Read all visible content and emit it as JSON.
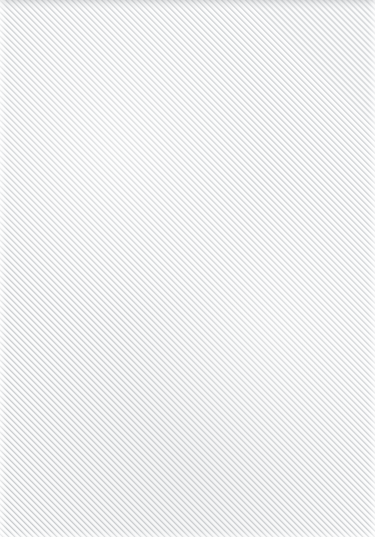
{
  "canvas": {
    "width": 375,
    "height": 537,
    "description": "Diagonal stripe placeholder texture",
    "alt_text": ""
  },
  "pattern": {
    "type": "diagonal-stripes",
    "angle_degrees": 45,
    "direction": "bottom-left to top-right",
    "horizontal_period_px": 6,
    "perpendicular_period_px": 4.24,
    "antialiased": true,
    "light_stripe_color": "#fdfdfd",
    "dark_stripe_color": "#c9cbcd",
    "mid_stripe_color": "#dddfe1",
    "background_color": "#fdfdfd"
  },
  "edges": {
    "top_shade_color": "#a8aaad",
    "top_shade_height_px": 9,
    "left_highlight_width_px": 7,
    "right_highlight_width_px": 7,
    "bottom_highlight_height_px": 6
  },
  "content": {
    "has_text": false,
    "has_icons": false,
    "has_controls": false,
    "text_items": []
  }
}
